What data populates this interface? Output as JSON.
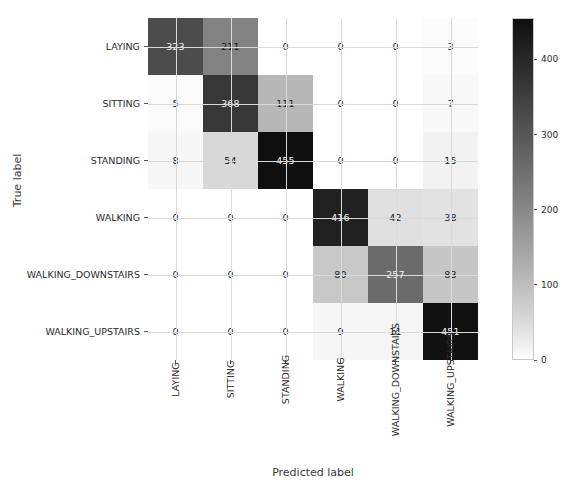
{
  "chart_data": {
    "type": "heatmap",
    "subtype": "confusion-matrix",
    "title": "",
    "xlabel": "Predicted label",
    "ylabel": "True label",
    "categories": [
      "LAYING",
      "SITTING",
      "STANDING",
      "WALKING",
      "WALKING_DOWNSTAIRS",
      "WALKING_UPSTAIRS"
    ],
    "x_tick_labels": [
      "LAYING",
      "SITTING",
      "STANDING",
      "WALKING",
      "WALKING_DOWNSTAIRS",
      "WALKING_UPSTAIRS"
    ],
    "y_tick_labels": [
      "LAYING",
      "SITTING",
      "STANDING",
      "WALKING",
      "WALKING_DOWNSTAIRS",
      "WALKING_UPSTAIRS"
    ],
    "matrix": [
      [
        323,
        211,
        0,
        0,
        0,
        3
      ],
      [
        5,
        368,
        111,
        0,
        0,
        7
      ],
      [
        8,
        54,
        455,
        0,
        0,
        15
      ],
      [
        0,
        0,
        0,
        416,
        42,
        38
      ],
      [
        0,
        0,
        0,
        80,
        257,
        83
      ],
      [
        0,
        0,
        0,
        9,
        11,
        451
      ]
    ],
    "rows": [
      {
        "label": "LAYING",
        "values": [
          323,
          211,
          0,
          0,
          0,
          3
        ]
      },
      {
        "label": "SITTING",
        "values": [
          5,
          368,
          111,
          0,
          0,
          7
        ]
      },
      {
        "label": "STANDING",
        "values": [
          8,
          54,
          455,
          0,
          0,
          15
        ]
      },
      {
        "label": "WALKING",
        "values": [
          0,
          0,
          0,
          416,
          42,
          38
        ]
      },
      {
        "label": "WALKING_DOWNSTAIRS",
        "values": [
          0,
          0,
          0,
          80,
          257,
          83
        ]
      },
      {
        "label": "WALKING_UPSTAIRS",
        "values": [
          0,
          0,
          0,
          9,
          11,
          451
        ]
      }
    ],
    "colorbar": {
      "ticks": [
        0,
        100,
        200,
        300,
        400
      ],
      "tick_labels": [
        "0",
        "100",
        "200",
        "300",
        "400"
      ],
      "vmin": 0,
      "vmax": 455,
      "colormap": "greys",
      "low_color": "#ffffff",
      "high_color": "#1b1b1b",
      "position": "right"
    },
    "grid": true,
    "legend": "none",
    "text_color_dark": "#1a1a1a",
    "text_color_light": "#f2f2f2"
  }
}
